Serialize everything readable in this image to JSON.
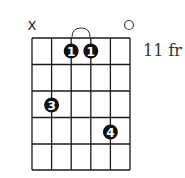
{
  "diagram": {
    "type": "guitar-chord-chart",
    "strings": 6,
    "frets_shown": 5,
    "start_fret_label": "11 fr",
    "string_markers": [
      {
        "string": 1,
        "symbol": "X",
        "meaning": "muted"
      },
      {
        "string": 6,
        "symbol": "○",
        "meaning": "open"
      }
    ],
    "barre": {
      "from_string": 3,
      "to_string": 4,
      "fret": 1
    },
    "fingers": [
      {
        "string": 3,
        "fret": 1,
        "label": "1"
      },
      {
        "string": 4,
        "fret": 1,
        "label": "1"
      },
      {
        "string": 2,
        "fret": 3,
        "label": "3"
      },
      {
        "string": 5,
        "fret": 4,
        "label": "4"
      }
    ],
    "colors": {
      "grid": "#1a1a1a",
      "dot_fill": "#111111",
      "dot_text": "#ffffff",
      "label": "#333333"
    }
  }
}
